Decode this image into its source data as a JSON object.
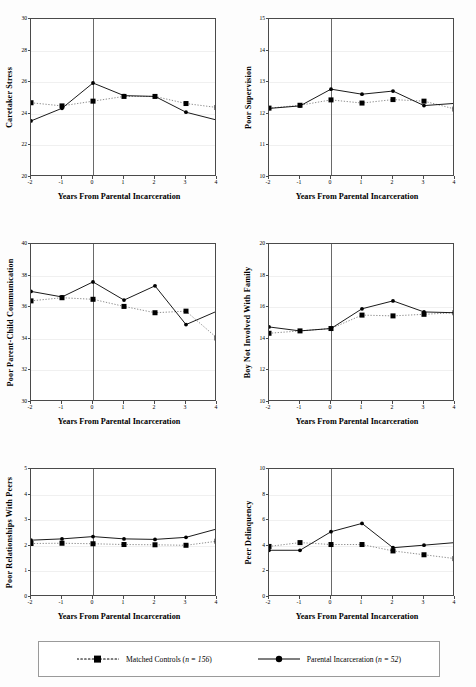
{
  "figure": {
    "xlabel": "Years From Parental Incarceration",
    "x_ticks": [
      "-2",
      "-1",
      "0",
      "1",
      "2",
      "3",
      "4"
    ]
  },
  "legend": {
    "controls_label": "Matched Controls (n = 156)",
    "controls_name": "Matched Controls",
    "controls_n": "n = 156",
    "treated_label": "Parental Incarceration (n = 52)",
    "treated_name": "Parental Incarceration",
    "treated_n": "n = 52"
  },
  "colors": {
    "line": "#000000",
    "axis": "#4a4a4a",
    "grid": "#f0f0f0",
    "zeroline": "#6a6a6a",
    "controls_line": "#808080"
  },
  "panels": [
    {
      "id": "caretaker-stress",
      "ylabel": "Caretaker Stress",
      "annotation": "(n = 208; observations = 1,086)",
      "annotation_n": "n = 208",
      "annotation_obs": "observations = 1,086",
      "yticks": [
        "20",
        "22",
        "24",
        "26",
        "28",
        "30"
      ]
    },
    {
      "id": "poor-supervision",
      "ylabel": "Poor Supervision",
      "annotation": "(n = 208; observations = 1,158)",
      "annotation_n": "n = 208",
      "annotation_obs": "observations = 1,158",
      "yticks": [
        "10",
        "11",
        "12",
        "13",
        "14",
        "15"
      ]
    },
    {
      "id": "poor-parent-child-communication",
      "ylabel": "Poor Parent-Child Communication",
      "annotation": "(n = 208; observations = 1,159)",
      "annotation_n": "n = 208",
      "annotation_obs": "observations = 1,159",
      "yticks": [
        "30",
        "32",
        "34",
        "36",
        "38",
        "40"
      ]
    },
    {
      "id": "boy-not-involved-with-family",
      "ylabel": "Boy Not Involved With Family",
      "annotation": "(n = 208; observations = 1,140)",
      "annotation_n": "n = 208",
      "annotation_obs": "observations = 1,140",
      "yticks": [
        "10",
        "12",
        "14",
        "16",
        "18",
        "20"
      ]
    },
    {
      "id": "poor-relationships-with-peers",
      "ylabel": "Poor Relationships With Peers",
      "annotation": "(n = 208; observations = 1,173)",
      "annotation_n": "n = 208",
      "annotation_obs": "observations = 1,173",
      "yticks": [
        "0",
        "1",
        "2",
        "3",
        "4",
        "5"
      ]
    },
    {
      "id": "peer-delinquency",
      "ylabel": "Peer Delinquency",
      "annotation": "(n = 208; observations = 1,303)",
      "annotation_n": "n = 208",
      "annotation_obs": "observations = 1,303",
      "yticks": [
        "0",
        "2",
        "4",
        "6",
        "8",
        "10"
      ]
    }
  ],
  "chart_data": [
    {
      "type": "line",
      "title": "Caretaker Stress",
      "ylabel": "Caretaker Stress",
      "xlabel": "Years From Parental Incarceration",
      "x": [
        -2,
        -1,
        0,
        1,
        2,
        3,
        4
      ],
      "xlim": [
        -2,
        4
      ],
      "ylim": [
        20,
        30
      ],
      "yticks": [
        20,
        22,
        24,
        26,
        28,
        30
      ],
      "grid": true,
      "annotation": "(n = 208; observations = 1,086)",
      "series": [
        {
          "name": "Matched Controls",
          "style": "dotted",
          "marker": "square",
          "values": [
            24.7,
            24.5,
            24.8,
            25.1,
            25.1,
            24.65,
            24.4
          ]
        },
        {
          "name": "Parental Incarceration",
          "style": "solid",
          "marker": "circle",
          "values": [
            23.55,
            24.35,
            25.95,
            25.15,
            25.1,
            24.1,
            23.6
          ]
        }
      ]
    },
    {
      "type": "line",
      "title": "Poor Supervision",
      "ylabel": "Poor Supervision",
      "xlabel": "Years From Parental Incarceration",
      "x": [
        -2,
        -1,
        0,
        1,
        2,
        3,
        4
      ],
      "xlim": [
        -2,
        4
      ],
      "ylim": [
        10,
        15
      ],
      "yticks": [
        10,
        11,
        12,
        13,
        14,
        15
      ],
      "grid": true,
      "annotation": "(n = 208; observations = 1,158)",
      "series": [
        {
          "name": "Matched Controls",
          "style": "dotted",
          "marker": "square",
          "values": [
            12.18,
            12.27,
            12.44,
            12.34,
            12.45,
            12.4,
            12.15
          ]
        },
        {
          "name": "Parental Incarceration",
          "style": "solid",
          "marker": "circle",
          "values": [
            12.17,
            12.25,
            12.78,
            12.62,
            12.72,
            12.26,
            12.33
          ]
        }
      ]
    },
    {
      "type": "line",
      "title": "Poor Parent-Child Communication",
      "ylabel": "Poor Parent-Child Communication",
      "xlabel": "Years From Parental Incarceration",
      "x": [
        -2,
        -1,
        0,
        1,
        2,
        3,
        4
      ],
      "xlim": [
        -2,
        4
      ],
      "ylim": [
        30,
        40
      ],
      "yticks": [
        30,
        32,
        34,
        36,
        38,
        40
      ],
      "grid": true,
      "annotation": "(n = 208; observations = 1,159)",
      "series": [
        {
          "name": "Matched Controls",
          "style": "dotted",
          "marker": "square",
          "values": [
            36.4,
            36.6,
            36.5,
            36.05,
            35.65,
            35.75,
            34.05
          ]
        },
        {
          "name": "Parental Incarceration",
          "style": "solid",
          "marker": "circle",
          "values": [
            37.0,
            36.65,
            37.6,
            36.45,
            37.35,
            34.9,
            35.75
          ]
        }
      ]
    },
    {
      "type": "line",
      "title": "Boy Not Involved With Family",
      "ylabel": "Boy Not Involved With Family",
      "xlabel": "Years From Parental Incarceration",
      "x": [
        -2,
        -1,
        0,
        1,
        2,
        3,
        4
      ],
      "xlim": [
        -2,
        4
      ],
      "ylim": [
        10,
        20
      ],
      "yticks": [
        10,
        12,
        14,
        16,
        18,
        20
      ],
      "grid": true,
      "annotation": "(n = 208; observations = 1,140)",
      "series": [
        {
          "name": "Matched Controls",
          "style": "dotted",
          "marker": "square",
          "values": [
            14.35,
            14.5,
            14.65,
            15.5,
            15.45,
            15.55,
            15.65
          ]
        },
        {
          "name": "Parental Incarceration",
          "style": "solid",
          "marker": "circle",
          "values": [
            14.75,
            14.5,
            14.65,
            15.9,
            16.4,
            15.7,
            15.65
          ]
        }
      ]
    },
    {
      "type": "line",
      "title": "Poor Relationships With Peers",
      "ylabel": "Poor Relationships With Peers",
      "xlabel": "Years From Parental Incarceration",
      "x": [
        -2,
        -1,
        0,
        1,
        2,
        3,
        4
      ],
      "xlim": [
        -2,
        4
      ],
      "ylim": [
        0,
        5
      ],
      "yticks": [
        0,
        1,
        2,
        3,
        4,
        5
      ],
      "grid": true,
      "annotation": "(n = 208; observations = 1,173)",
      "series": [
        {
          "name": "Matched Controls",
          "style": "dotted",
          "marker": "square",
          "values": [
            2.09,
            2.1,
            2.08,
            2.05,
            2.04,
            2.02,
            2.18
          ]
        },
        {
          "name": "Parental Incarceration",
          "style": "solid",
          "marker": "circle",
          "values": [
            2.22,
            2.27,
            2.36,
            2.27,
            2.25,
            2.33,
            2.66
          ]
        }
      ]
    },
    {
      "type": "line",
      "title": "Peer Delinquency",
      "ylabel": "Peer Delinquency",
      "xlabel": "Years From Parental Incarceration",
      "x": [
        -2,
        -1,
        0,
        1,
        2,
        3,
        4
      ],
      "xlim": [
        -2,
        4
      ],
      "ylim": [
        0,
        10
      ],
      "yticks": [
        0,
        2,
        4,
        6,
        8,
        10
      ],
      "grid": true,
      "annotation": "(n = 208; observations = 1,303)",
      "series": [
        {
          "name": "Matched Controls",
          "style": "dotted",
          "marker": "square",
          "values": [
            3.95,
            4.25,
            4.1,
            4.1,
            3.6,
            3.3,
            3.0
          ]
        },
        {
          "name": "Parental Incarceration",
          "style": "solid",
          "marker": "circle",
          "values": [
            3.65,
            3.65,
            5.1,
            5.75,
            3.85,
            4.05,
            4.25
          ]
        }
      ]
    }
  ]
}
